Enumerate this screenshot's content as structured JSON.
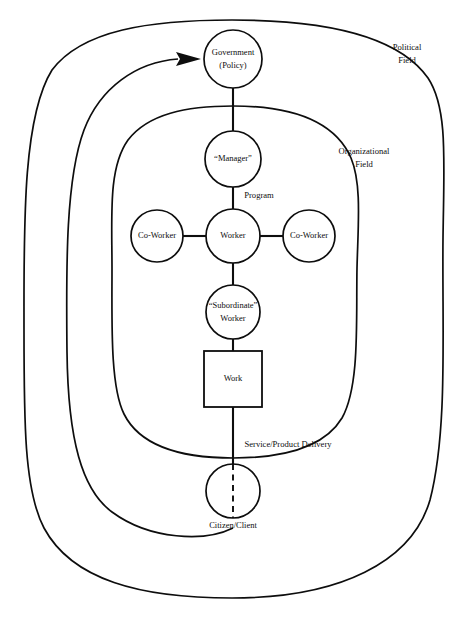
{
  "diagram": {
    "background_color": "#ffffff",
    "line_color": "#0d0d0d",
    "fields": [
      {
        "id": "political",
        "label_line1": "Political",
        "label_line2": "Field"
      },
      {
        "id": "organizational",
        "label_line1": "Organizational",
        "label_line2": "Field"
      }
    ],
    "nodes": [
      {
        "id": "government",
        "shape": "circle",
        "label_line1": "Government",
        "label_line2": "(Policy)"
      },
      {
        "id": "manager",
        "shape": "circle",
        "label_line1": "“Manager”",
        "label_line2": ""
      },
      {
        "id": "coworker_left",
        "shape": "circle",
        "label_line1": "Co-Worker",
        "label_line2": ""
      },
      {
        "id": "worker",
        "shape": "circle",
        "label_line1": "Worker",
        "label_line2": ""
      },
      {
        "id": "coworker_right",
        "shape": "circle",
        "label_line1": "Co-Worker",
        "label_line2": ""
      },
      {
        "id": "subordinate",
        "shape": "circle",
        "label_line1": "“Subordinate”",
        "label_line2": "Worker"
      },
      {
        "id": "work",
        "shape": "rectangle",
        "label_line1": "Work",
        "label_line2": ""
      },
      {
        "id": "citizen",
        "shape": "circle",
        "label_line1": "Citizen/Client",
        "label_line2": ""
      }
    ],
    "edge_labels": [
      {
        "id": "program",
        "text": "Program"
      },
      {
        "id": "service_delivery",
        "text": "Service/Product Delivery"
      }
    ]
  }
}
